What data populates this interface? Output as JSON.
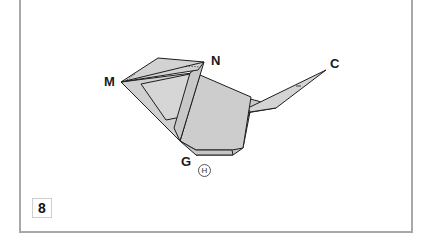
{
  "diagram": {
    "type": "origami-fold-step",
    "step_number": "8",
    "labels": {
      "M": "M",
      "N": "N",
      "C": "C",
      "G": "G",
      "H": "H"
    },
    "colors": {
      "paper_fill": "#cfcfcf",
      "paper_fill_light": "#d8d8d8",
      "outline": "#1e1e1e",
      "frame_border": "#a8a8a8"
    }
  }
}
